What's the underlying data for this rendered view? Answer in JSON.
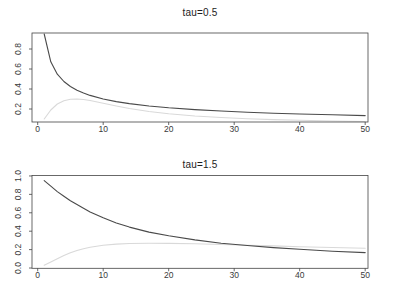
{
  "figure": {
    "background": "#ffffff",
    "curve_color_dark": "#4a4a4a",
    "curve_color_light": "#d9d9d9",
    "axis_color": "#444444",
    "tick_label_color": "#3a3a3a"
  },
  "chart_data": [
    {
      "type": "line",
      "title": "tau=0.5",
      "xlabel": "",
      "ylabel": "",
      "grid": false,
      "legend": null,
      "xlim": [
        -0.87,
        50.43
      ],
      "ylim": [
        0.07,
        0.96
      ],
      "x_tick_values": [
        0,
        10,
        20,
        30,
        40,
        50
      ],
      "x_tick_labels": [
        "0",
        "10",
        "20",
        "30",
        "40",
        "50"
      ],
      "y_tick_values": [
        0.2,
        0.4,
        0.6,
        0.8
      ],
      "y_tick_labels": [
        "0.2",
        "0.4",
        "0.6",
        "0.8"
      ],
      "series": [
        {
          "name": "decay-curve",
          "color": "#4a4a4a",
          "x": [
            1,
            2,
            3,
            4,
            5,
            6,
            7,
            8,
            10,
            12,
            14,
            17,
            20,
            24,
            28,
            32,
            36,
            40,
            45,
            50
          ],
          "y": [
            0.95,
            0.672,
            0.548,
            0.475,
            0.425,
            0.388,
            0.359,
            0.336,
            0.3,
            0.274,
            0.254,
            0.23,
            0.212,
            0.194,
            0.18,
            0.168,
            0.158,
            0.15,
            0.142,
            0.134
          ]
        },
        {
          "name": "rise-fall-curve",
          "color": "#d9d9d9",
          "x": [
            1,
            2,
            3,
            4,
            5,
            6,
            7,
            8,
            10,
            12,
            14,
            17,
            20,
            24,
            28,
            32,
            36,
            40,
            45,
            50
          ],
          "y": [
            0.1,
            0.19,
            0.25,
            0.283,
            0.297,
            0.3,
            0.295,
            0.285,
            0.258,
            0.23,
            0.205,
            0.175,
            0.152,
            0.13,
            0.115,
            0.103,
            0.094,
            0.087,
            0.08,
            0.074
          ]
        }
      ]
    },
    {
      "type": "line",
      "title": "tau=1.5",
      "xlabel": "",
      "ylabel": "",
      "grid": false,
      "legend": null,
      "xlim": [
        -0.87,
        50.43
      ],
      "ylim": [
        -0.003,
        1.005
      ],
      "x_tick_values": [
        0,
        10,
        20,
        30,
        40,
        50
      ],
      "x_tick_labels": [
        "0",
        "10",
        "20",
        "30",
        "40",
        "50"
      ],
      "y_tick_values": [
        0.0,
        0.2,
        0.4,
        0.6,
        0.8,
        1.0
      ],
      "y_tick_labels": [
        "0.0",
        "0.2",
        "0.4",
        "0.6",
        "0.8",
        "1.0"
      ],
      "series": [
        {
          "name": "decay-curve",
          "color": "#4a4a4a",
          "x": [
            1,
            2,
            3,
            4,
            5,
            6,
            7,
            8,
            10,
            12,
            14,
            17,
            20,
            24,
            28,
            32,
            36,
            40,
            45,
            50
          ],
          "y": [
            0.95,
            0.89,
            0.83,
            0.78,
            0.73,
            0.69,
            0.65,
            0.61,
            0.545,
            0.49,
            0.445,
            0.39,
            0.35,
            0.305,
            0.27,
            0.245,
            0.222,
            0.203,
            0.183,
            0.168
          ]
        },
        {
          "name": "rise-plateau-curve",
          "color": "#d9d9d9",
          "x": [
            1,
            2,
            3,
            4,
            5,
            6,
            7,
            8,
            10,
            12,
            14,
            17,
            20,
            24,
            28,
            32,
            36,
            40,
            45,
            50
          ],
          "y": [
            0.03,
            0.065,
            0.1,
            0.135,
            0.165,
            0.19,
            0.21,
            0.225,
            0.248,
            0.26,
            0.266,
            0.269,
            0.268,
            0.263,
            0.256,
            0.248,
            0.24,
            0.232,
            0.223,
            0.214
          ]
        }
      ]
    }
  ]
}
